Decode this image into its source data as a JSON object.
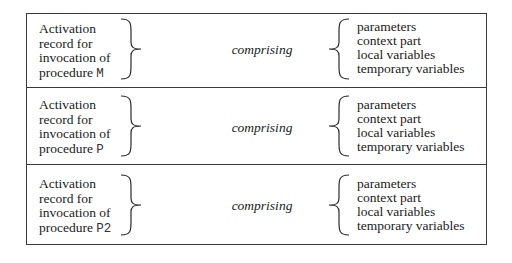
{
  "rows": [
    {
      "label_lines": [
        "Activation",
        "record for",
        "invocation of",
        "procedure "
      ],
      "procedure": "M",
      "connector": "comprising",
      "components": [
        "parameters",
        "context part",
        "local variables",
        "temporary variables"
      ]
    },
    {
      "label_lines": [
        "Activation",
        "record for",
        "invocation of",
        "procedure "
      ],
      "procedure": "P",
      "connector": "comprising",
      "components": [
        "parameters",
        "context part",
        "local variables",
        "temporary variables"
      ]
    },
    {
      "label_lines": [
        "Activation",
        "record for",
        "invocation of",
        "procedure "
      ],
      "procedure": "P2",
      "connector": "comprising",
      "components": [
        "parameters",
        "context part",
        "local variables",
        "temporary variables"
      ]
    }
  ]
}
